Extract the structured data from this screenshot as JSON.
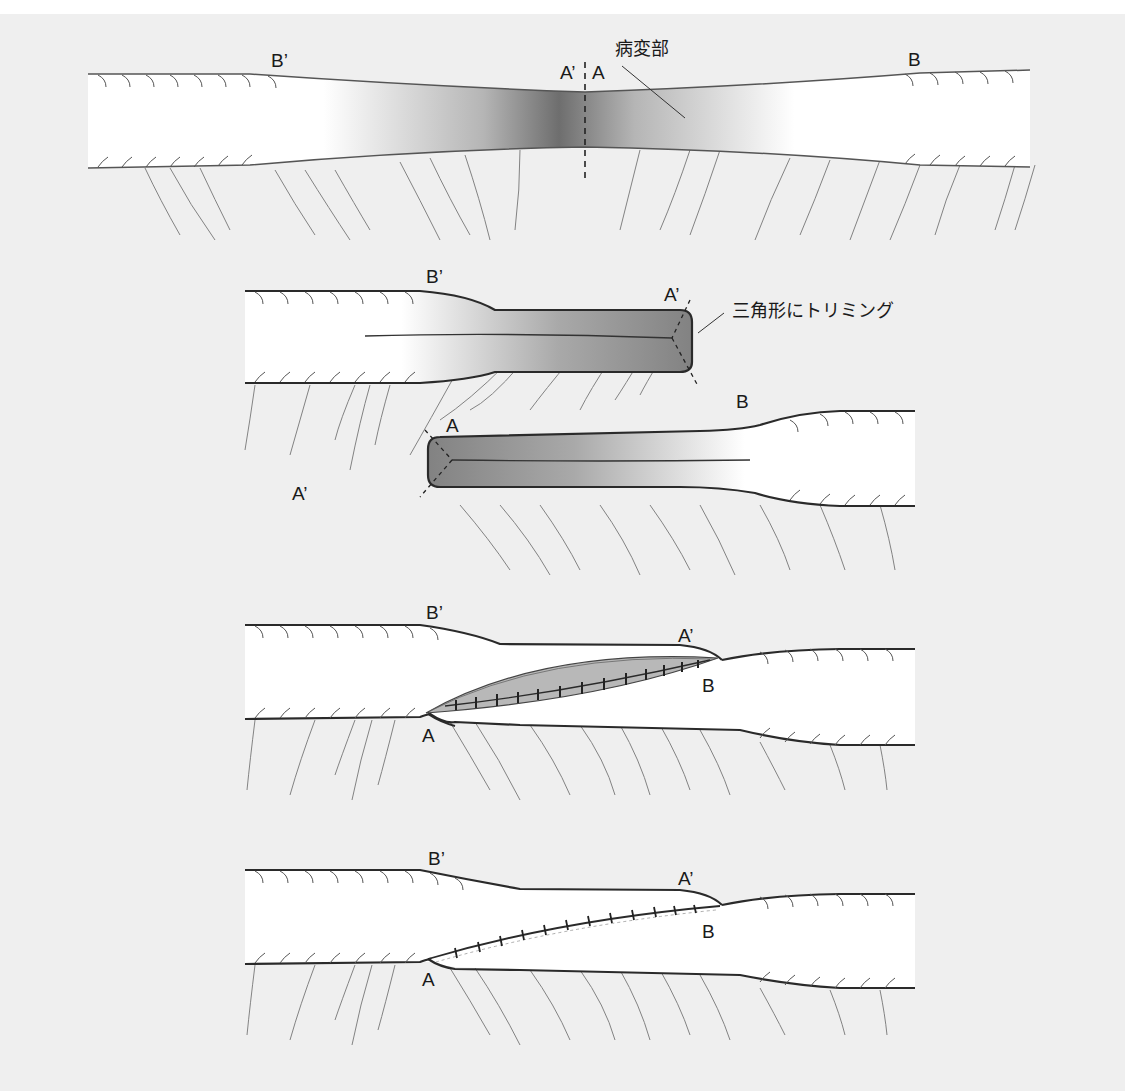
{
  "figure": {
    "colors": {
      "background": "#efefef",
      "vessel_fill": "#ffffff",
      "outline": "#2a2a2a",
      "lesion_dark": "#7a7a7a",
      "trimmed_fill": "#8c8c8c",
      "suture_fill": "#b5b5b5"
    },
    "panel1": {
      "label_bprime": "B’",
      "label_aprime": "A’",
      "label_a": "A",
      "label_b": "B",
      "lesion_label": "病変部"
    },
    "panel2": {
      "label_bprime": "B’",
      "label_aprime_end": "A’",
      "trim_label": "三角形にトリミング",
      "label_a": "A",
      "label_b": "B",
      "label_aprime_stray": "A’"
    },
    "panel3": {
      "label_bprime": "B’",
      "label_aprime": "A’",
      "label_b": "B",
      "label_a": "A"
    },
    "panel4": {
      "label_bprime": "B’",
      "label_aprime": "A’",
      "label_b": "B",
      "label_a": "A"
    }
  }
}
